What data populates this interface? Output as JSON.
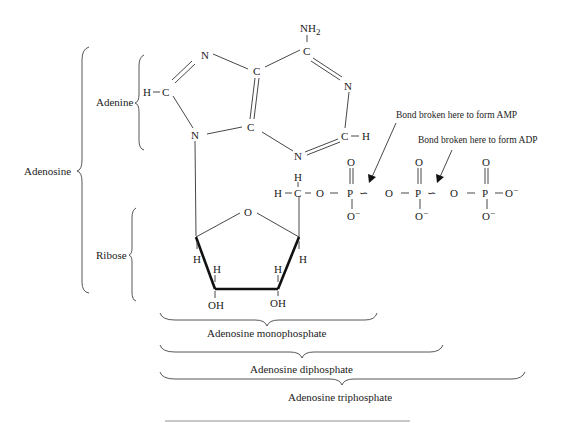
{
  "diagram": {
    "type": "chemical-structure",
    "colors": {
      "ink": "#222222",
      "background": "#ffffff",
      "footer_rule": "#c8c8c8"
    },
    "group_labels": {
      "adenosine": "Adenosine",
      "adenine": "Adenine",
      "ribose": "Ribose",
      "amp": "Adenosine monophosphate",
      "adp": "Adenosine diphosphate",
      "atp": "Adenosine triphosphate"
    },
    "annotations": {
      "amp_bond": "Bond broken here to form AMP",
      "adp_bond": "Bond broken here to form ADP"
    },
    "atoms": {
      "nh2": "NH",
      "nh2_sub": "2",
      "n7": "N",
      "c8": "C",
      "h8": "H",
      "n9": "N",
      "c4": "C",
      "c5": "C",
      "c6": "C",
      "n1": "N",
      "c2": "C",
      "h2": "H",
      "n3": "N",
      "ring_o": "O",
      "h1p": "H",
      "h2p": "H",
      "h3p": "H",
      "h4p": "H",
      "oh2p": "OH",
      "oh3p": "OH",
      "h5a": "H",
      "h5b": "H",
      "c5p": "C",
      "o5p": "O",
      "pa": "P",
      "pa_o_top": "O",
      "pa_o_bot": "O",
      "bridge1": "O",
      "pb": "P",
      "pb_o_top": "O",
      "pb_o_bot": "O",
      "bridge2": "O",
      "pg": "P",
      "pg_o_top": "O",
      "pg_o_bot": "O",
      "pg_o_right": "O",
      "charge": "−",
      "high_energy_bond": "∽"
    }
  }
}
